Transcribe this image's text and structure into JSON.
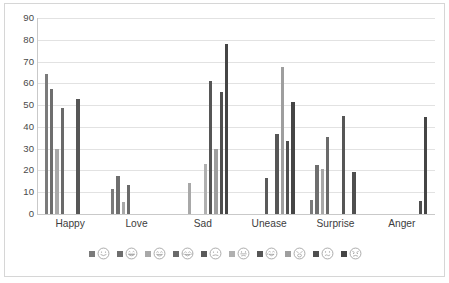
{
  "chart_data": {
    "type": "bar",
    "title": "",
    "subtitle": "",
    "xlabel": "",
    "ylabel": "",
    "ylim": [
      0,
      90
    ],
    "ytick_step": 10,
    "ytick_labels": [
      "0",
      "10",
      "20",
      "30",
      "40",
      "50",
      "60",
      "70",
      "80",
      "90"
    ],
    "grid": true,
    "legend_position": "bottom",
    "categories": [
      "Happy",
      "Love",
      "Sad",
      "Unease",
      "Surprise",
      "Anger"
    ],
    "series": [
      {
        "name": "face-1-smiling",
        "icon": "smiling-face-icon",
        "color": "#7b7b7b",
        "values": [
          64.5,
          11.5,
          0,
          0,
          6.5,
          0
        ]
      },
      {
        "name": "face-2-grinning",
        "icon": "grinning-face-icon",
        "color": "#6e6e6e",
        "values": [
          57.5,
          17.5,
          0,
          0,
          22.3,
          0
        ]
      },
      {
        "name": "face-3-laughing",
        "icon": "laughing-face-icon",
        "color": "#a8a8a8",
        "values": [
          30.0,
          5.5,
          14.2,
          0,
          20.5,
          0
        ]
      },
      {
        "name": "face-4-tears-of-joy",
        "icon": "tears-of-joy-face-icon",
        "color": "#6a6a6a",
        "values": [
          48.8,
          13.5,
          0,
          0,
          35.5,
          0
        ]
      },
      {
        "name": "face-5-neutral",
        "icon": "neutral-face-icon",
        "color": "#5a5a5a",
        "values": [
          0,
          0,
          0,
          16.6,
          0,
          0
        ]
      },
      {
        "name": "face-6-frowning",
        "icon": "frowning-face-icon",
        "color": "#b0b0b0",
        "values": [
          0,
          0,
          22.8,
          0,
          0,
          0
        ]
      },
      {
        "name": "face-7-sad-crying",
        "icon": "sad-crying-face-icon",
        "color": "#565656",
        "values": [
          52.7,
          0,
          61.0,
          36.7,
          45.2,
          0
        ]
      },
      {
        "name": "face-8-weary",
        "icon": "weary-face-icon",
        "color": "#9e9e9e",
        "values": [
          0,
          0,
          30.0,
          67.5,
          0,
          0
        ]
      },
      {
        "name": "face-9-confused",
        "icon": "confused-face-icon",
        "color": "#4f4f4f",
        "values": [
          0,
          0,
          55.8,
          33.5,
          19.1,
          5.8
        ]
      },
      {
        "name": "face-10-angry",
        "icon": "angry-face-icon",
        "color": "#454545",
        "values": [
          0,
          0,
          77.9,
          51.4,
          0,
          44.7
        ]
      }
    ]
  }
}
